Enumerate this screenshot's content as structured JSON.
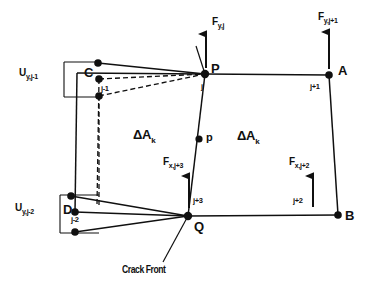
{
  "figure": {
    "background": "#ffffff",
    "ink": "#101010"
  },
  "points": {
    "P": "P",
    "Q": "Q",
    "A": "A",
    "B": "B",
    "C": "C",
    "D": "D",
    "p_mid": "p"
  },
  "node_labels": {
    "j": "j",
    "j_plus_1": "j+1",
    "j_plus_2": "j+2",
    "j_plus_3": "j+3",
    "j_minus_1": "j-1",
    "j_minus_2": "j-2"
  },
  "forces": [
    {
      "id": "fy-j",
      "base": "F",
      "sub": "y,j",
      "direction": "up",
      "at": "P"
    },
    {
      "id": "fy-j1",
      "base": "F",
      "sub": "y,j+1",
      "direction": "up",
      "at": "A"
    },
    {
      "id": "fx-j3",
      "base": "F",
      "sub": "x,j+3",
      "direction": "up",
      "at": "j+3"
    },
    {
      "id": "fx-j2",
      "base": "F",
      "sub": "x,j+2",
      "direction": "up",
      "at": "j+2"
    }
  ],
  "displacements": [
    {
      "id": "uy-j1",
      "base": "U",
      "sub": "y,j-1",
      "at": "C"
    },
    {
      "id": "uy-j2",
      "base": "U",
      "sub": "y,j-2",
      "at": "D"
    }
  ],
  "areas": [
    {
      "id": "area-left",
      "base": "ΔA",
      "sub": "k"
    },
    {
      "id": "area-right",
      "base": "ΔA",
      "sub": "k"
    }
  ],
  "annotations": {
    "crack_front": "Crack Front"
  }
}
